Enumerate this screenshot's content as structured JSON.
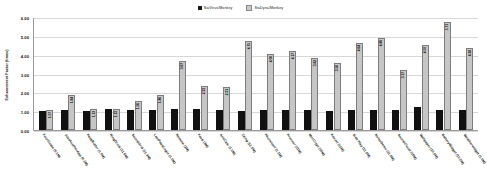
{
  "chart_data": {
    "type": "bar",
    "title": "",
    "xlabel": "",
    "ylabel": "Enhancement Factor (times)",
    "ylim": [
      0.0,
      6.0
    ],
    "yticks": [
      "0.00",
      "1.00",
      "2.00",
      "3.00",
      "4.00",
      "5.00",
      "6.00"
    ],
    "grid": true,
    "legend_position": "top-center",
    "categories": [
      "FourGoats (0.1M)",
      "JustAnotherApp (0.1M)",
      "PassButler (1.0M)",
      "RingDroid (11.6M)",
      "SoundGrid (11.3M)",
      "LastPassLogin (1.0M)",
      "Remote (2M)",
      "Feed (3M)",
      "AntiCalc (1.0M)",
      "Zxing (11.0M)",
      "Phonetool (1.1M)",
      "Prunner (11M)",
      "MozCrypt (10M)",
      "Keezel (11M)",
      "Sisk Play (11.0M)",
      "NoiseDemo (11.0M)",
      "SoundCloud (10M)",
      "Wallpaper (10.0M)",
      "BatteryWidget (10.0M)",
      "Weatherwidget (1.0M)"
    ],
    "series": [
      {
        "name": "NaiVirus/Monkey",
        "color": "#111111",
        "values": [
          1.0,
          1.07,
          1.03,
          1.1,
          1.08,
          1.04,
          1.11,
          1.11,
          1.05,
          1.03,
          1.06,
          1.06,
          1.05,
          1.0,
          1.05,
          1.05,
          1.06,
          1.22,
          1.07,
          1.06
        ],
        "labels": [
          "1.00",
          "1.07",
          "1.03",
          "1.10",
          "1.08",
          "",
          "",
          "",
          "",
          "",
          "",
          "",
          "",
          "",
          "",
          "",
          "",
          "",
          "",
          ""
        ]
      },
      {
        "name": "StaDyna/Monkey",
        "color": "#c6c6c6",
        "values": [
          1.07,
          1.84,
          1.13,
          1.13,
          1.56,
          1.86,
          3.67,
          2.33,
          2.31,
          4.75,
          4.06,
          4.17,
          3.82,
          3.56,
          4.64,
          4.86,
          3.17,
          4.5,
          5.71,
          4.38
        ],
        "labels": [
          "1.07",
          "1.84",
          "1.13",
          "1.13",
          "1.56",
          "1.86",
          "3.67",
          "2.33",
          "2.31",
          "4.75",
          "4.06",
          "4.17",
          "3.82",
          "3.56",
          "4.64",
          "4.86",
          "3.17",
          "4.50",
          "5.71",
          "4.38"
        ]
      }
    ],
    "extra_series_note": {
      "count": 20,
      "last_two_gray": [
        4.4,
        4.36
      ],
      "last_two_labels": [
        "4.40",
        "4.36"
      ]
    }
  },
  "legend": {
    "items": [
      {
        "label": "NaiVirus/Monkey",
        "color": "#111111"
      },
      {
        "label": "StaDyna/Monkey",
        "color": "#c6c6c6"
      }
    ]
  }
}
